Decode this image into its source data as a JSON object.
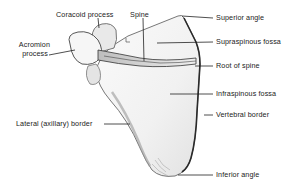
{
  "diagram": {
    "labels": {
      "coracoid_process": "Coracoid process",
      "spine": "Spine",
      "acromion_line1": "Acromion",
      "acromion_line2": "process",
      "superior_angle": "Superior angle",
      "supraspinous_fossa": "Supraspinous fossa",
      "root_of_spine": "Root of spine",
      "infraspinous_fossa": "Infraspinous fossa",
      "vertebral_border": "Vertebral border",
      "lateral_border": "Lateral (axillary) border",
      "inferior_angle": "Inferior angle"
    },
    "colors": {
      "background": "#ffffff",
      "bone_fill": "#f4f4f4",
      "bone_shade": "#cfcfcf",
      "outline": "#333333",
      "leader_line": "#222222",
      "text": "#222222"
    }
  }
}
